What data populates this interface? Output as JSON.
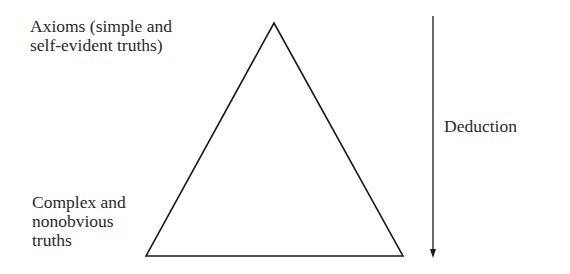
{
  "diagram": {
    "top_label": {
      "lines": [
        "Axioms (simple and",
        "self-evident truths)"
      ]
    },
    "bottom_label": {
      "lines": [
        "Complex and",
        "nonobvious",
        "truths"
      ]
    },
    "arrow_label": "Deduction",
    "shapes": {
      "triangle": {
        "apex": [
          274,
          23
        ],
        "base_left": [
          146,
          256
        ],
        "base_right": [
          403,
          256
        ],
        "stroke": "#1a1a1a"
      },
      "arrow": {
        "x": 433,
        "y_start": 16,
        "y_end": 258,
        "direction": "down",
        "stroke": "#1a1a1a"
      }
    }
  }
}
